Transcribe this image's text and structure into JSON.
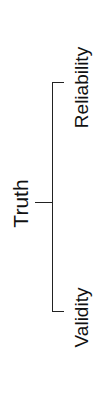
{
  "diagram": {
    "root": {
      "label": "Truth"
    },
    "children": [
      {
        "label": "Reliability"
      },
      {
        "label": "Validity"
      }
    ],
    "line_color": "#222222",
    "text_color": "#111111"
  }
}
